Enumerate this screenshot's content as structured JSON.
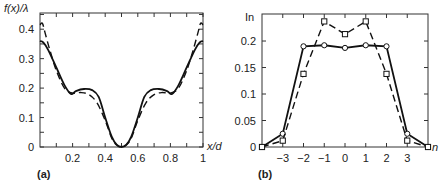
{
  "chart_data": [
    {
      "panel": "(a)",
      "type": "line",
      "title": "",
      "xlabel": "x/d",
      "ylabel": "f(x)/λ",
      "xlim": [
        0,
        1
      ],
      "ylim": [
        0,
        0.45
      ],
      "xticks": [
        "0.2",
        "0.4",
        "0.6",
        "0.8",
        "1"
      ],
      "yticks": [
        "0",
        "0.1",
        "0.2",
        "0.3",
        "0.4"
      ],
      "grid": false,
      "series": [
        {
          "name": "solid",
          "style": "solid",
          "x": [
            0,
            0.02,
            0.05,
            0.1,
            0.15,
            0.19,
            0.22,
            0.27,
            0.32,
            0.36,
            0.4,
            0.44,
            0.47,
            0.5,
            0.53,
            0.56,
            0.6,
            0.64,
            0.68,
            0.73,
            0.78,
            0.81,
            0.85,
            0.9,
            0.95,
            0.98,
            1
          ],
          "y": [
            0.36,
            0.355,
            0.33,
            0.27,
            0.21,
            0.18,
            0.19,
            0.197,
            0.193,
            0.17,
            0.1,
            0.035,
            0.008,
            0,
            0.008,
            0.035,
            0.1,
            0.17,
            0.193,
            0.197,
            0.19,
            0.18,
            0.21,
            0.27,
            0.33,
            0.355,
            0.36
          ]
        },
        {
          "name": "dashed",
          "style": "dashed",
          "x": [
            0,
            0.015,
            0.03,
            0.06,
            0.1,
            0.15,
            0.2,
            0.25,
            0.3,
            0.35,
            0.4,
            0.44,
            0.47,
            0.5,
            0.53,
            0.56,
            0.6,
            0.65,
            0.7,
            0.75,
            0.8,
            0.85,
            0.9,
            0.94,
            0.97,
            0.985,
            1
          ],
          "y": [
            0.415,
            0.42,
            0.39,
            0.33,
            0.26,
            0.2,
            0.183,
            0.185,
            0.178,
            0.15,
            0.09,
            0.03,
            0.007,
            0,
            0.007,
            0.03,
            0.09,
            0.15,
            0.178,
            0.185,
            0.183,
            0.2,
            0.26,
            0.33,
            0.39,
            0.42,
            0.415
          ]
        }
      ]
    },
    {
      "panel": "(b)",
      "type": "line",
      "title": "",
      "xlabel": "n",
      "ylabel": "In",
      "xlim": [
        -4,
        4
      ],
      "ylim": [
        0,
        0.25
      ],
      "xticks": [
        "−3",
        "−2",
        "−1",
        "0",
        "1",
        "2",
        "3"
      ],
      "yticks": [
        "0",
        "0.05",
        "0.1",
        "0.15",
        "0.2"
      ],
      "grid": false,
      "series": [
        {
          "name": "circles-solid",
          "style": "solid",
          "marker": "circle",
          "x": [
            -4,
            -3,
            -2,
            -1,
            0,
            1,
            2,
            3,
            4
          ],
          "y": [
            0,
            0.025,
            0.19,
            0.192,
            0.187,
            0.192,
            0.19,
            0.025,
            0
          ]
        },
        {
          "name": "squares-dashed",
          "style": "dashed",
          "marker": "square",
          "x": [
            -4,
            -3,
            -2,
            -1,
            0,
            1,
            2,
            3,
            4
          ],
          "y": [
            0,
            0.012,
            0.138,
            0.237,
            0.213,
            0.237,
            0.138,
            0.012,
            0
          ]
        }
      ]
    }
  ],
  "panels": {
    "a": {
      "label": "(a)",
      "ylabel": "f(x)/λ",
      "xlabel": "x/d",
      "yticks": [
        "0",
        "0.1",
        "0.2",
        "0.3",
        "0.4"
      ],
      "xticks": [
        "0.2",
        "0.4",
        "0.6",
        "0.8",
        "1"
      ]
    },
    "b": {
      "label": "(b)",
      "ylabel": "In",
      "xlabel": "n",
      "yticks": [
        "0",
        "0.05",
        "0.1",
        "0.15",
        "0.2"
      ],
      "xticks": [
        "−3",
        "−2",
        "−1",
        "0",
        "1",
        "2",
        "3"
      ]
    }
  }
}
